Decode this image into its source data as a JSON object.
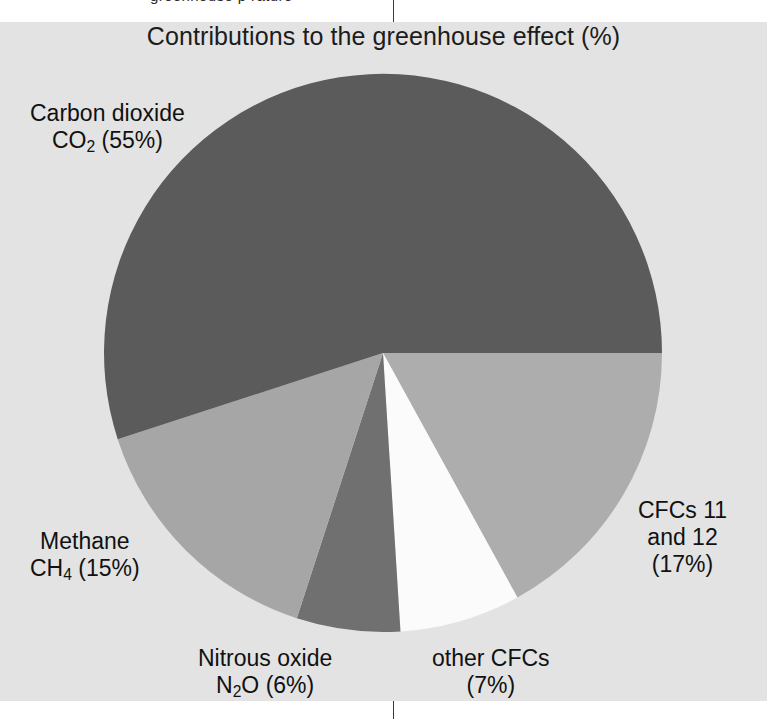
{
  "page": {
    "bleed_text_top": "greenhouse  p        rature",
    "background_color": "#e3e3e3",
    "page_color": "#ffffff"
  },
  "chart_data": {
    "type": "pie",
    "title": "Contributions to the greenhouse effect (%)",
    "xlabel": "",
    "ylabel": "",
    "legend_position": "none",
    "grid": false,
    "units": "%",
    "start_angle_deg": 90,
    "direction": "clockwise",
    "categories": [
      "Carbon dioxide CO2",
      "CFCs 11 and 12",
      "other CFCs",
      "Nitrous oxide N2O",
      "Methane CH4"
    ],
    "values": [
      55,
      17,
      7,
      6,
      15
    ],
    "colors": [
      "#5b5b5b",
      "#adadad",
      "#fbfbfb",
      "#707070",
      "#a6a6a6"
    ],
    "slices": [
      {
        "key": "co2",
        "name": "Carbon dioxide",
        "formula_prefix": "CO",
        "formula_sub": "2",
        "formula_suffix": " (55%)",
        "value": 55,
        "color": "#5b5b5b",
        "label_lines": [
          "Carbon dioxide",
          "CO2 (55%)"
        ]
      },
      {
        "key": "cfc1112",
        "name": "CFCs 11",
        "value": 17,
        "color": "#adadad",
        "label_lines": [
          "CFCs 11",
          "and 12",
          "(17%)"
        ]
      },
      {
        "key": "other_cfcs",
        "name": "other CFCs",
        "value": 7,
        "color": "#fbfbfb",
        "label_lines": [
          "other CFCs",
          "(7%)"
        ]
      },
      {
        "key": "n2o",
        "name": "Nitrous oxide",
        "formula_prefix": "N",
        "formula_sub": "2",
        "formula_suffix": "O (6%)",
        "value": 6,
        "color": "#707070",
        "label_lines": [
          "Nitrous oxide",
          "N2O (6%)"
        ]
      },
      {
        "key": "ch4",
        "name": "Methane",
        "formula_prefix": "CH",
        "formula_sub": "4",
        "formula_suffix": " (15%)",
        "value": 15,
        "color": "#a6a6a6",
        "label_lines": [
          "Methane",
          "CH4 (15%)"
        ]
      }
    ]
  },
  "labels": {
    "co2": {
      "line1": "Carbon dioxide",
      "formula_prefix": "CO",
      "formula_sub": "2",
      "formula_suffix": " (55%)"
    },
    "methane": {
      "line1": "Methane",
      "formula_prefix": "CH",
      "formula_sub": "4",
      "formula_suffix": " (15%)"
    },
    "n2o": {
      "line1": "Nitrous oxide",
      "formula_prefix": "N",
      "formula_sub": "2",
      "formula_suffix": "O (6%)"
    },
    "other_cfcs": {
      "line1": "other CFCs",
      "line2": "(7%)"
    },
    "cfc_11_12": {
      "line1": "CFCs 11",
      "line2": "and 12",
      "line3": "(17%)"
    }
  }
}
